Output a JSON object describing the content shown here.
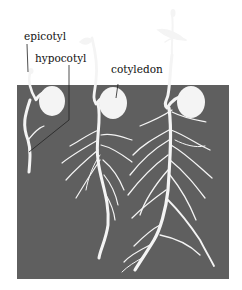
{
  "diagram": {
    "labels": {
      "epicotyl": "epicotyl",
      "hypocotyl": "hypocotyl",
      "cotyledon": "cotyledon"
    },
    "stages": [
      {
        "name": "early seedling"
      },
      {
        "name": "middle seedling"
      },
      {
        "name": "late seedling"
      }
    ],
    "colors": {
      "soil": "#5f5f5f",
      "plant": "#f4f4f4",
      "background": "#ffffff",
      "leader_line": "#222222"
    }
  }
}
